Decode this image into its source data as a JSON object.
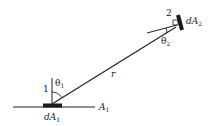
{
  "diagram": {
    "type": "radiation view factor geometry",
    "surface1": {
      "number_label": "1",
      "area_label_main": "dA",
      "area_label_sub": "1",
      "plane_label_main": "A",
      "plane_label_sub": "1"
    },
    "surface2": {
      "number_label": "2",
      "area_label_main": "dA",
      "area_label_sub": "2"
    },
    "angles": [
      {
        "symbol": "θ",
        "sub": "1"
      },
      {
        "symbol": "θ",
        "sub": "2"
      }
    ],
    "distance_label": "r",
    "colors": {
      "line": "#222222",
      "patch": "#1a1a1a",
      "background": "#ffffff"
    }
  }
}
